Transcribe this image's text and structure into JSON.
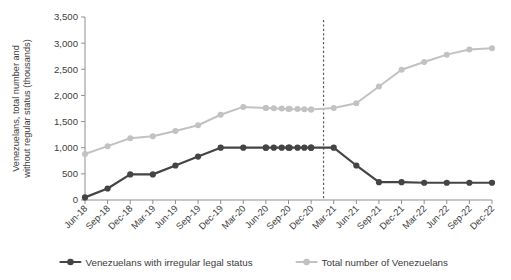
{
  "chart_data": {
    "type": "line",
    "title": "",
    "xlabel": "",
    "ylabel": "Venezuelans, total number and without regular status (thousands)",
    "ylim": [
      0,
      3500
    ],
    "ytick_labels": [
      "0",
      "500",
      "1,000",
      "1,500",
      "2,000",
      "2,500",
      "3,000",
      "3,500"
    ],
    "ytick_values": [
      0,
      500,
      1000,
      1500,
      2000,
      2500,
      3000,
      3500
    ],
    "grid": false,
    "legend_position": "bottom",
    "categories": [
      "Jun-18",
      "Sep-18",
      "Dec-18",
      "Mar-19",
      "Jun-19",
      "Sep-19",
      "Dec-19",
      "Mar-20",
      "Jun-20",
      "Sep-20",
      "Dec-20",
      "Mar-21",
      "Jun-21",
      "Sep-21",
      "Dec-21",
      "Mar-22",
      "Jun-22",
      "Sep-22",
      "Dec-22"
    ],
    "series": [
      {
        "name": "Venezuelans with irregular legal status",
        "color": "#444444",
        "values": [
          50,
          220,
          490,
          490,
          660,
          830,
          1000,
          1000,
          1000,
          1000,
          1000,
          1000,
          660,
          340,
          340,
          330,
          330,
          330,
          330
        ]
      },
      {
        "name": "Total number of Venezuelans",
        "color": "#c2c2c2",
        "values": [
          880,
          1030,
          1180,
          1220,
          1320,
          1430,
          1630,
          1780,
          1760,
          1740,
          1730,
          1760,
          1850,
          2170,
          2490,
          2640,
          2780,
          2880,
          2900
        ]
      }
    ],
    "extra_markers": {
      "note": "monthly markers clustered between Jun-20 and Dec-20",
      "x_fractions": [
        8.0,
        8.35,
        8.7,
        9.05,
        9.4,
        9.7,
        10.0
      ],
      "irregular_values": [
        1000,
        1000,
        1000,
        1000,
        1000,
        1000,
        1000
      ],
      "total_values": [
        1760,
        1755,
        1750,
        1745,
        1740,
        1735,
        1730
      ]
    },
    "annotations": [
      {
        "type": "vertical-dashed-line",
        "label": "",
        "x_category_fraction": 10.55
      }
    ]
  },
  "legend": {
    "items": [
      {
        "label": "Venezuelans with irregular legal status",
        "color": "#444444"
      },
      {
        "label": "Total number of Venezuelans",
        "color": "#c2c2c2"
      }
    ]
  }
}
